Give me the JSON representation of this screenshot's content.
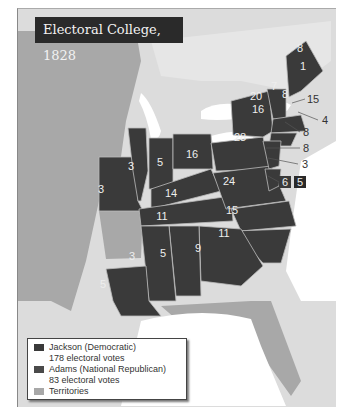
{
  "title": "Electoral College, 1828",
  "colors": {
    "jackson": "#3a3a3a",
    "adams": "#4a4a4a",
    "territories": "#a8a8a8",
    "water": "#ffffff",
    "land_bg": "#d8d8d8"
  },
  "legend": {
    "jackson_label": "Jackson (Democratic)",
    "jackson_votes": "178 electoral votes",
    "adams_label": "Adams (National Republican)",
    "adams_votes": "83 electoral votes",
    "territories_label": "Territories"
  },
  "states": {
    "me_a": "8",
    "me_b": "1",
    "vt": "7",
    "nh": "8",
    "ny_a": "20",
    "ny_b": "16",
    "ma": "15",
    "ri": "4",
    "ct": "8",
    "nj": "8",
    "de": "3",
    "md_a": "6",
    "md_b": "5",
    "pa": "28",
    "oh": "16",
    "in": "5",
    "il": "3",
    "mo": "3",
    "ky": "14",
    "va": "24",
    "tn": "11",
    "nc": "15",
    "sc": "11",
    "ga": "9",
    "al": "5",
    "ms": "3",
    "la": "5"
  }
}
